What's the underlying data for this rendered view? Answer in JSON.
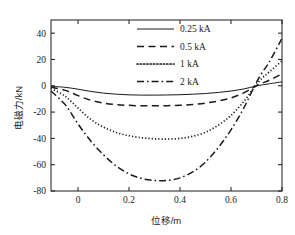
{
  "chart_data": {
    "type": "line",
    "title": "",
    "xlabel": "位移/m",
    "ylabel": "电磁力/kN",
    "xlim": [
      -0.106,
      0.8
    ],
    "ylim": [
      -80,
      50
    ],
    "xticks": [
      "0",
      "0.2",
      "0.4",
      "0.6",
      "0.8"
    ],
    "xtick_values": [
      0,
      0.2,
      0.4,
      0.6,
      0.8
    ],
    "yticks": [
      "40",
      "20",
      "0",
      "-20",
      "-40",
      "-60",
      "-80"
    ],
    "ytick_values": [
      40,
      20,
      0,
      -20,
      -40,
      -60,
      -80
    ],
    "grid": false,
    "legend_position": "upper-center",
    "series": [
      {
        "name": "0.25 kA",
        "style": "solid",
        "x": [
          -0.106,
          -0.05,
          0.0,
          0.05,
          0.1,
          0.15,
          0.2,
          0.25,
          0.3,
          0.35,
          0.4,
          0.45,
          0.5,
          0.55,
          0.6,
          0.65,
          0.69,
          0.72,
          0.75,
          0.8
        ],
        "y": [
          -0.4,
          -1.2,
          -2.6,
          -4.3,
          -5.6,
          -6.4,
          -6.9,
          -7.1,
          -7.1,
          -7.0,
          -6.8,
          -6.4,
          -5.9,
          -5.1,
          -4.0,
          -2.4,
          -0.6,
          0.6,
          1.5,
          3.0
        ]
      },
      {
        "name": "0.5 kA",
        "style": "dashed",
        "x": [
          -0.106,
          -0.05,
          0.0,
          0.05,
          0.1,
          0.15,
          0.2,
          0.25,
          0.3,
          0.35,
          0.4,
          0.45,
          0.5,
          0.55,
          0.6,
          0.65,
          0.69,
          0.72,
          0.75,
          0.8
        ],
        "y": [
          -1.0,
          -3.5,
          -7.5,
          -11.0,
          -13.2,
          -14.3,
          -14.9,
          -15.2,
          -15.2,
          -15.1,
          -14.8,
          -14.2,
          -13.2,
          -11.6,
          -9.2,
          -5.4,
          -1.0,
          1.8,
          4.2,
          9.0
        ]
      },
      {
        "name": "1 kA",
        "style": "dotted",
        "x": [
          -0.106,
          -0.05,
          0.0,
          0.05,
          0.1,
          0.15,
          0.2,
          0.25,
          0.3,
          0.35,
          0.4,
          0.45,
          0.5,
          0.55,
          0.6,
          0.65,
          0.69,
          0.72,
          0.75,
          0.8
        ],
        "y": [
          -2.0,
          -8.0,
          -17.0,
          -25.5,
          -31.5,
          -35.5,
          -38.0,
          -39.5,
          -40.3,
          -40.5,
          -40.0,
          -38.4,
          -35.3,
          -30.0,
          -22.5,
          -12.0,
          -1.5,
          5.5,
          10.5,
          19.0
        ]
      },
      {
        "name": "2 kA",
        "style": "dashdot",
        "x": [
          -0.106,
          -0.05,
          0.0,
          0.05,
          0.1,
          0.15,
          0.2,
          0.25,
          0.3,
          0.35,
          0.4,
          0.45,
          0.5,
          0.55,
          0.6,
          0.65,
          0.69,
          0.72,
          0.75,
          0.8
        ],
        "y": [
          -4.0,
          -14.5,
          -29.0,
          -42.0,
          -52.5,
          -61.0,
          -67.0,
          -70.5,
          -72.0,
          -72.0,
          -70.0,
          -65.5,
          -58.0,
          -47.0,
          -33.5,
          -17.0,
          -1.0,
          9.5,
          18.0,
          36.0
        ]
      }
    ],
    "legend": [
      {
        "label": "0.25 kA",
        "style": "solid"
      },
      {
        "label": "0.5 kA",
        "style": "dashed"
      },
      {
        "label": "1 kA",
        "style": "dotted"
      },
      {
        "label": "2 kA",
        "style": "dashdot"
      }
    ],
    "line_color": "#1a1a1a"
  }
}
